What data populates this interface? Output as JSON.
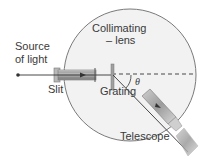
{
  "labels": {
    "source_line1": "Source",
    "source_line2": "of light",
    "collimating_line1": "Collimating",
    "collimating_line2": "lens",
    "slit": "Slit",
    "grating": "Grating",
    "theta": "θ",
    "telescope": "Telescope"
  },
  "colors": {
    "disc_fill": "#f2f2f2",
    "disc_stroke": "#7a7a7a",
    "tube": "#9a9a9a",
    "ray": "#333333",
    "text": "#3a3a3a"
  }
}
